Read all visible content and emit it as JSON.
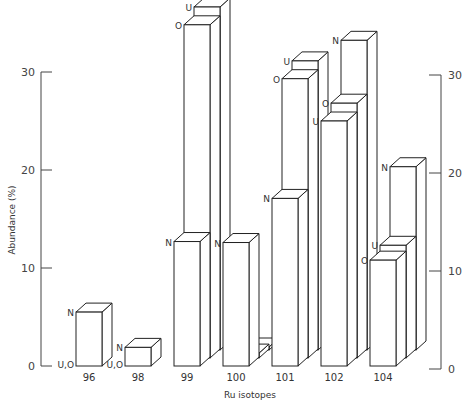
{
  "chart_data": {
    "type": "bar",
    "style": "3d-grouped",
    "title": "",
    "xlabel": "Ru isotopes",
    "ylabel": "Abundance (%)",
    "ylim": [
      0,
      30
    ],
    "yticks": [
      0,
      10,
      20,
      30
    ],
    "categories": [
      "96",
      "98",
      "99",
      "100",
      "101",
      "102",
      "104"
    ],
    "series": [
      {
        "name": "N",
        "values": [
          5.5,
          1.9,
          12.7,
          12.6,
          17.1,
          31.6,
          18.7
        ]
      },
      {
        "name": "O",
        "values": [
          0,
          0,
          34.0,
          0.5,
          28.5,
          26.0,
          10.8
        ]
      },
      {
        "name": "U",
        "values": [
          0,
          0,
          35.0,
          0,
          29.5,
          25.0,
          11.5
        ]
      }
    ],
    "bar_labels": [
      {
        "category": "96",
        "labels": [
          "N",
          "U,O"
        ]
      },
      {
        "category": "98",
        "labels": [
          "N",
          "U,O"
        ]
      },
      {
        "category": "99",
        "labels": [
          "N",
          "O",
          "U"
        ]
      },
      {
        "category": "100",
        "labels": [
          "N",
          "O",
          "U"
        ]
      },
      {
        "category": "101",
        "labels": [
          "N",
          "O",
          "U"
        ]
      },
      {
        "category": "102",
        "labels": [
          "U",
          "O",
          "N"
        ]
      },
      {
        "category": "104",
        "labels": [
          "O",
          "U",
          "N"
        ]
      }
    ],
    "grid": false,
    "legend": "none (series letters annotated on bars)",
    "axes": {
      "left": [
        0,
        30
      ],
      "right": [
        0,
        30
      ]
    }
  }
}
